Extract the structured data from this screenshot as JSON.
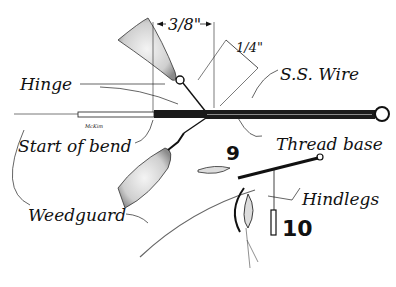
{
  "figure": {
    "labels": {
      "hinge": "Hinge",
      "start_of_bend": "Start of bend",
      "weedguard": "Weedguard",
      "ss_wire": "S.S. Wire",
      "thread_base": "Thread base",
      "hindlegs": "Hindlegs"
    },
    "dimensions": {
      "three_eighths": "3/8\"",
      "one_quarter": "1/4\""
    },
    "figure_numbers": {
      "fig9": "9",
      "fig10": "10"
    },
    "signature": "McKim"
  }
}
